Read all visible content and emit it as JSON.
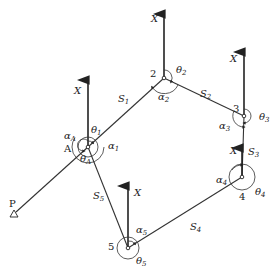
{
  "diagram": {
    "known_point": {
      "id": "P",
      "label": "P",
      "x": 14,
      "y": 214,
      "symbol": "triangle"
    },
    "start_point": {
      "id": "A",
      "label": "A",
      "x": 88,
      "y": 147
    },
    "stations": [
      {
        "id": "2",
        "label": "2",
        "x": 164,
        "y": 78
      },
      {
        "id": "3",
        "label": "3",
        "x": 244,
        "y": 116
      },
      {
        "id": "4",
        "label": "4",
        "x": 242,
        "y": 177
      },
      {
        "id": "5",
        "label": "5",
        "x": 128,
        "y": 248
      }
    ],
    "sides": [
      {
        "label": "S",
        "sub": "1",
        "from": "A",
        "to": "2"
      },
      {
        "label": "S",
        "sub": "2",
        "from": "2",
        "to": "3"
      },
      {
        "label": "S",
        "sub": "3",
        "from": "3",
        "to": "4"
      },
      {
        "label": "S",
        "sub": "4",
        "from": "4",
        "to": "5"
      },
      {
        "label": "S",
        "sub": "5",
        "from": "5",
        "to": "A"
      }
    ],
    "north_axis_label": "X",
    "angles": {
      "alpha_A": {
        "sym": "α",
        "sub": "A"
      },
      "theta_A": {
        "sym": "θ",
        "sub": "A"
      },
      "theta_1": {
        "sym": "θ",
        "sub": "1"
      },
      "alpha_1": {
        "sym": "α",
        "sub": "1"
      },
      "theta_2": {
        "sym": "θ",
        "sub": "2"
      },
      "alpha_2": {
        "sym": "α",
        "sub": "2"
      },
      "theta_3": {
        "sym": "θ",
        "sub": "3"
      },
      "alpha_3": {
        "sym": "α",
        "sub": "3"
      },
      "theta_4": {
        "sym": "θ",
        "sub": "4"
      },
      "alpha_4": {
        "sym": "α",
        "sub": "4"
      },
      "theta_5": {
        "sym": "θ",
        "sub": "5"
      },
      "alpha_5": {
        "sym": "α",
        "sub": "5"
      }
    }
  }
}
